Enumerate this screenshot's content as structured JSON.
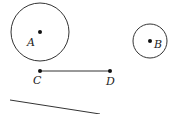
{
  "diagram": {
    "circles": [
      {
        "label": "A",
        "cx": 40,
        "cy": 32,
        "r": 29
      },
      {
        "label": "B",
        "cx": 150,
        "cy": 41,
        "r": 17
      }
    ],
    "segment": {
      "start_label": "C",
      "end_label": "D",
      "x1": 40,
      "y1": 71,
      "x2": 110,
      "y2": 71
    },
    "line": {
      "x1": 10,
      "y1": 100,
      "x2": 100,
      "y2": 114
    },
    "stroke_color": "#333333"
  }
}
